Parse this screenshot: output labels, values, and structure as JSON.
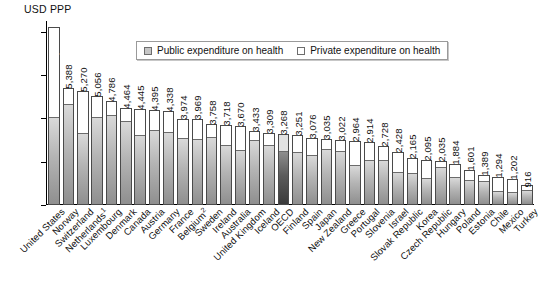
{
  "chart_data": {
    "type": "bar",
    "title": "",
    "subtitle": "",
    "ylabel": "USD PPP",
    "xlabel": "",
    "ylim": [
      0,
      8500
    ],
    "yticks": [
      0,
      2000,
      4000,
      6000,
      8000
    ],
    "ytick_labels": [
      "0",
      "2,000",
      "4,000",
      "6,000",
      "8,000"
    ],
    "grid": false,
    "legend_position": "top-center",
    "stacked": true,
    "legend": [
      {
        "key": "public",
        "label": "Public expenditure on health",
        "color": "#c6c6c6"
      },
      {
        "key": "private",
        "label": "Private expenditure on health",
        "color": "#ffffff"
      }
    ],
    "categories": [
      "United States",
      "Norway",
      "Switzerland",
      "Netherlands¹",
      "Luxembourg",
      "Denmark",
      "Canada",
      "Austria",
      "Germany",
      "France",
      "Belgium²",
      "Sweden",
      "Ireland",
      "Australia",
      "United Kingdom",
      "Iceland",
      "OECD",
      "Finland",
      "Spain",
      "Japan",
      "New Zealand",
      "Greece",
      "Portugal",
      "Slovenia",
      "Israel",
      "Slovak Republic",
      "Korea",
      "Czech Republic",
      "Hungary",
      "Poland",
      "Estonia",
      "Chile",
      "Mexico",
      "Turkey"
    ],
    "category_labels_raw": [
      "United States",
      "Norway",
      "Switzerland",
      "Netherlands",
      "Luxembourg",
      "Denmark",
      "Canada",
      "Austria",
      "Germany",
      "France",
      "Belgium",
      "Sweden",
      "Ireland",
      "Australia",
      "United Kingdom",
      "Iceland",
      "OECD",
      "Finland",
      "Spain",
      "Japan",
      "New Zealand",
      "Greece",
      "Portugal",
      "Slovenia",
      "Israel",
      "Slovak Republic",
      "Korea",
      "Czech Republic",
      "Hungary",
      "Poland",
      "Estonia",
      "Chile",
      "Mexico",
      "Turkey"
    ],
    "category_footnotes": [
      "",
      "",
      "",
      "1",
      "",
      "",
      "",
      "",
      "",
      "",
      "2",
      "",
      "",
      "",
      "",
      "",
      "",
      "",
      "",
      "",
      "",
      "",
      "",
      "",
      "",
      "",
      "",
      "",
      "",
      "",
      "",
      "",
      "",
      ""
    ],
    "totals": [
      8233,
      5388,
      5270,
      5056,
      4786,
      4464,
      4445,
      4395,
      4338,
      3974,
      3969,
      3758,
      3718,
      3670,
      3433,
      3309,
      3268,
      3251,
      3076,
      3035,
      3022,
      2964,
      2914,
      2728,
      2428,
      2165,
      2095,
      2035,
      1884,
      1601,
      1389,
      1294,
      1202,
      916
    ],
    "total_labels": [
      "8,233",
      "5,388",
      "5,270",
      "5,056",
      "4,786",
      "4,464",
      "4,445",
      "4,395",
      "4,338",
      "3,974",
      "3,969",
      "3,758",
      "3,718",
      "3,670",
      "3,433",
      "3,309",
      "3,268",
      "3,251",
      "3,076",
      "3,035",
      "3,022",
      "2,964",
      "2,914",
      "2,728",
      "2,428",
      "2,165",
      "2,095",
      "2,035",
      "1,884",
      "1,601",
      "1,389",
      "1,294",
      "1,202",
      "916"
    ],
    "extra_total_label": "913",
    "series": [
      {
        "name": "Public expenditure on health",
        "values": [
          4013,
          4601,
          3299,
          4012,
          4108,
          3813,
          3181,
          3423,
          3331,
          3062,
          2987,
          3107,
          2728,
          2500,
          2935,
          2740,
          2440,
          2421,
          2242,
          2553,
          2472,
          1786,
          2011,
          2021,
          1486,
          1439,
          1218,
          1715,
          1269,
          1128,
          1060,
          617,
          561,
          669
        ]
      },
      {
        "name": "Private expenditure on health",
        "values": [
          4220,
          787,
          1971,
          1044,
          678,
          651,
          1264,
          972,
          1007,
          912,
          982,
          651,
          990,
          1170,
          498,
          569,
          828,
          830,
          834,
          482,
          550,
          1178,
          903,
          707,
          942,
          726,
          877,
          320,
          615,
          473,
          329,
          677,
          641,
          247
        ]
      }
    ],
    "highlight_category": "OECD",
    "highlight_index": 16
  }
}
